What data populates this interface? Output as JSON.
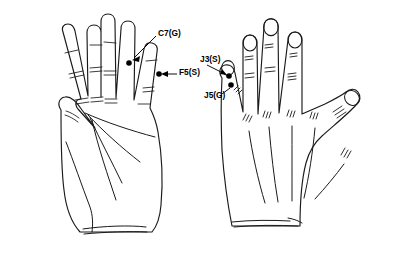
{
  "figure": {
    "background_color": "#ffffff",
    "line_color": "#1a1a1a",
    "marker_color": "#000000"
  },
  "hands": [
    {
      "id": "left-hand-palmar",
      "name": "left-hand-palmar-view",
      "view": "palmar",
      "side": "left"
    },
    {
      "id": "right-hand-dorsal",
      "name": "right-hand-dorsal-view",
      "view": "dorsal",
      "side": "right"
    }
  ],
  "annotations": [
    {
      "code": "C7(G)",
      "name": "point-label-c7g",
      "hand": "left-hand-palmar",
      "label_x": 158,
      "label_y": 34,
      "dot_x": 129,
      "dot_y": 63,
      "digit": "ring-finger"
    },
    {
      "code": "F5(S)",
      "name": "point-label-f5s",
      "hand": "left-hand-palmar",
      "label_x": 178,
      "label_y": 73,
      "dot_x": 159,
      "dot_y": 74,
      "digit": "little-finger"
    },
    {
      "code": "J3(S)",
      "name": "point-label-j3s",
      "hand": "right-hand-dorsal",
      "label_x": 200,
      "label_y": 60,
      "dot_x": 229,
      "dot_y": 76,
      "digit": "little-finger"
    },
    {
      "code": "J5(G)",
      "name": "point-label-j5g",
      "hand": "right-hand-dorsal",
      "label_x": 204,
      "label_y": 96,
      "dot_x": 231,
      "dot_y": 85,
      "digit": "little-finger"
    }
  ]
}
